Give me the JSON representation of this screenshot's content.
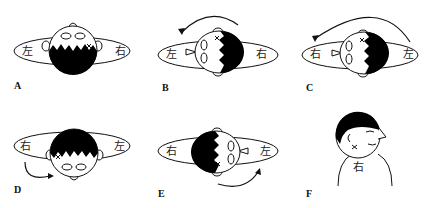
{
  "figure": {
    "panels": [
      {
        "id": "A",
        "label": "A",
        "left_text": "左",
        "right_text": "右"
      },
      {
        "id": "B",
        "label": "B",
        "left_text": "左",
        "right_text": "右"
      },
      {
        "id": "C",
        "label": "C",
        "left_text": "右",
        "right_text": "左"
      },
      {
        "id": "D",
        "label": "D",
        "left_text": "右",
        "right_text": "左"
      },
      {
        "id": "E",
        "label": "E",
        "left_text": "右",
        "right_text": "左"
      },
      {
        "id": "F",
        "label": "F",
        "body_text": "右"
      }
    ],
    "colors": {
      "line": "#111111",
      "fill_dark": "#000000",
      "background": "#ffffff"
    },
    "icons": [
      "head-topview-icon",
      "ellipse-table-icon",
      "rotation-arrow-icon",
      "x-mark-icon",
      "profile-figure-icon"
    ]
  }
}
